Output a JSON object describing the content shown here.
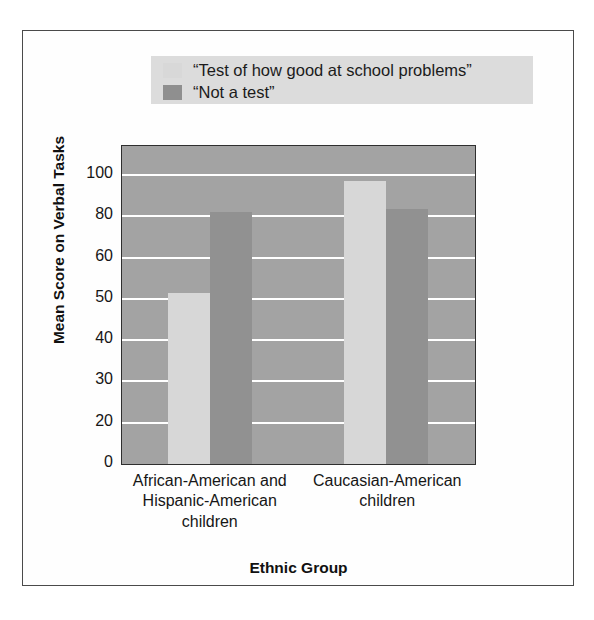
{
  "figure": {
    "background_color": "#ffffff",
    "border_color": "#4a4a4a"
  },
  "caption": {
    "text": ""
  },
  "chart_data": {
    "type": "bar",
    "title": "",
    "xlabel": "Ethnic Group",
    "ylabel": "Mean Score on Verbal Tasks",
    "categories": [
      "African-American and Hispanic-American children",
      "Caucasian-American children"
    ],
    "category_lines": [
      [
        "African-American and",
        "Hispanic-American",
        "children"
      ],
      [
        "Caucasian-American",
        "children"
      ]
    ],
    "series": [
      {
        "name": "“Test of how good at school problems”",
        "color": "#d7d7d7",
        "values": [
          61,
          101
        ]
      },
      {
        "name": "“Not a test”",
        "color": "#919191",
        "values": [
          90,
          91
        ]
      }
    ],
    "ytick_labels": [
      "100",
      "80",
      "60",
      "50",
      "40",
      "30",
      "20",
      "0"
    ],
    "ytick_values": [
      100,
      80,
      60,
      50,
      40,
      30,
      20,
      0
    ],
    "ylim": [
      0,
      113
    ],
    "grid": true,
    "grid_color": "#ffffff",
    "plot_background": "#a3a3a3",
    "legend_position": "above-plot",
    "legend_background": "#dcdcdc"
  },
  "legend": {
    "items": [
      {
        "label": "“Test of how good at school problems”",
        "swatch": "light"
      },
      {
        "label": "“Not a test”",
        "swatch": "dark"
      }
    ]
  }
}
